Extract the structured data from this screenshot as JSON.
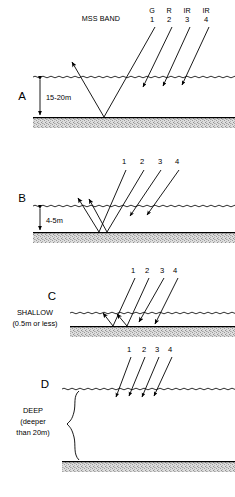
{
  "figure": {
    "title_label": "MSS BAND",
    "band_names": [
      "G",
      "R",
      "IR",
      "IR"
    ],
    "band_numbers": [
      "1",
      "2",
      "3",
      "4"
    ],
    "colors": {
      "ink": "#000000",
      "seabed_fill": "#d8d8d8",
      "background": "#ffffff"
    }
  },
  "panels": [
    {
      "id": "A",
      "letter": "A",
      "depth_label": "15-20m",
      "caption_lines": [],
      "ray_numbers": [
        "1",
        "2",
        "3",
        "4"
      ],
      "band_names": [
        "G",
        "R",
        "IR",
        "IR"
      ],
      "header_label": "MSS BAND",
      "bottom_ray_numbers": []
    },
    {
      "id": "B",
      "letter": "B",
      "depth_label": "4-5m",
      "caption_lines": [],
      "ray_numbers": [
        "1",
        "2",
        "3",
        "4"
      ],
      "band_names": [],
      "header_label": "",
      "bottom_ray_numbers": []
    },
    {
      "id": "C",
      "letter": "C",
      "depth_label": "",
      "caption_lines": [
        "SHALLOW",
        "(0.5m or less)"
      ],
      "ray_numbers": [
        "1",
        "2",
        "3",
        "4"
      ],
      "band_names": [],
      "header_label": "",
      "bottom_ray_numbers": []
    },
    {
      "id": "D",
      "letter": "D",
      "depth_label": "",
      "caption_lines": [
        "DEEP",
        "(deeper",
        "than 20m)"
      ],
      "ray_numbers": [
        "1",
        "2",
        "3",
        "4"
      ],
      "band_names": [],
      "header_label": "",
      "bottom_ray_numbers": []
    }
  ]
}
